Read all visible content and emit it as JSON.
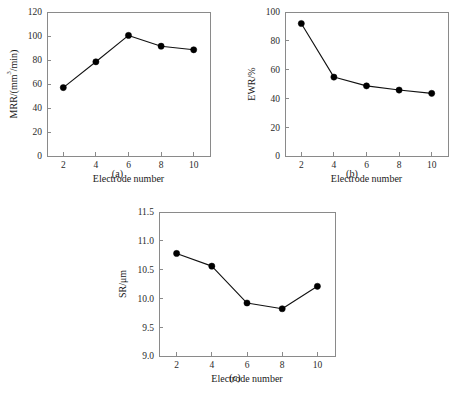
{
  "figure": {
    "background": "#ffffff",
    "line_color": "#111111",
    "marker_color": "#000000",
    "axis_color": "#8a8a8a"
  },
  "panels": [
    {
      "caption": "(a)",
      "xlabel": "Electrode number",
      "ylabel_main": "MRR/(mm",
      "ylabel_sup": "3",
      "ylabel_tail": "/min)",
      "ylabel_full": "MRR/(mm3/min)",
      "xticks": [
        "2",
        "4",
        "6",
        "8",
        "10"
      ],
      "yticks": [
        "0",
        "20",
        "40",
        "60",
        "80",
        "100",
        "120"
      ]
    },
    {
      "caption": "(b)",
      "xlabel": "Electrode number",
      "ylabel_main": "EWR/%",
      "ylabel_sup": "",
      "ylabel_tail": "",
      "ylabel_full": "EWR/%",
      "xticks": [
        "2",
        "4",
        "6",
        "8",
        "10"
      ],
      "yticks": [
        "0",
        "20",
        "40",
        "60",
        "80",
        "100"
      ]
    },
    {
      "caption": "(c)",
      "xlabel": "Electrode number",
      "ylabel_main": "SR/μm",
      "ylabel_sup": "",
      "ylabel_tail": "",
      "ylabel_full": "SR/μm",
      "xticks": [
        "2",
        "4",
        "6",
        "8",
        "10"
      ],
      "yticks": [
        "9.0",
        "9.5",
        "10.0",
        "10.5",
        "11.0",
        "11.5"
      ]
    }
  ],
  "chart_data": [
    {
      "type": "line",
      "panel": "(a)",
      "title": "",
      "xlabel": "Electrode number",
      "ylabel": "MRR/(mm3/min)",
      "x": [
        2,
        4,
        6,
        8,
        10
      ],
      "values": [
        57,
        78.5,
        100.5,
        91.5,
        88.5
      ],
      "xlim": [
        1,
        11
      ],
      "ylim": [
        0,
        120
      ],
      "xticks": [
        2,
        4,
        6,
        8,
        10
      ],
      "yticks": [
        0,
        20,
        40,
        60,
        80,
        100,
        120
      ],
      "grid": false,
      "legend": "none",
      "marker": "filled-circle"
    },
    {
      "type": "line",
      "panel": "(b)",
      "title": "",
      "xlabel": "Electrode number",
      "ylabel": "EWR/%",
      "x": [
        2,
        4,
        6,
        8,
        10
      ],
      "values": [
        92,
        54.8,
        48.7,
        45.8,
        43.5
      ],
      "xlim": [
        1,
        11
      ],
      "ylim": [
        0,
        100
      ],
      "xticks": [
        2,
        4,
        6,
        8,
        10
      ],
      "yticks": [
        0,
        20,
        40,
        60,
        80,
        100
      ],
      "grid": false,
      "legend": "none",
      "marker": "filled-circle"
    },
    {
      "type": "line",
      "panel": "(c)",
      "title": "",
      "xlabel": "Electrode number",
      "ylabel": "SR/μm",
      "x": [
        2,
        4,
        6,
        8,
        10
      ],
      "values": [
        10.78,
        10.56,
        9.92,
        9.82,
        10.21
      ],
      "xlim": [
        1,
        11
      ],
      "ylim": [
        9.0,
        11.5
      ],
      "xticks": [
        2,
        4,
        6,
        8,
        10
      ],
      "yticks": [
        9.0,
        9.5,
        10.0,
        10.5,
        11.0,
        11.5
      ],
      "grid": false,
      "legend": "none",
      "marker": "filled-circle"
    }
  ]
}
